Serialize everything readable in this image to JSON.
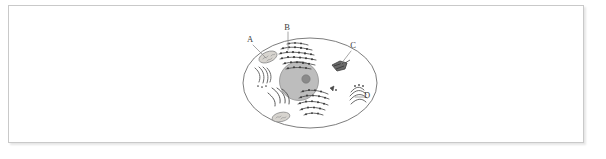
{
  "figure": {
    "frame": {
      "border_color": "#c9c9c9",
      "background_color": "#ffffff"
    }
  },
  "diagram": {
    "type": "labeled-biology-diagram",
    "outline_color": "#6e6e6e",
    "nucleus_fill": "#bdbdbd",
    "nucleolus_fill": "#8a8a8a",
    "organelle_dark": "#4a4a4a",
    "organelle_light": "#cfcfcf",
    "leader_line_color": "#8a8a8a",
    "labels": [
      {
        "id": "A",
        "text": "A",
        "x": 250,
        "y": 42,
        "points_to": "mitochondrion-upper-left"
      },
      {
        "id": "B",
        "text": "B",
        "x": 287,
        "y": 30,
        "points_to": "rough-endoplasmic-reticulum-top"
      },
      {
        "id": "C",
        "text": "C",
        "x": 353,
        "y": 48,
        "points_to": "organelle-upper-right"
      },
      {
        "id": "D",
        "text": "D",
        "x": 367,
        "y": 98,
        "points_to": "golgi-apparatus-right"
      }
    ]
  }
}
